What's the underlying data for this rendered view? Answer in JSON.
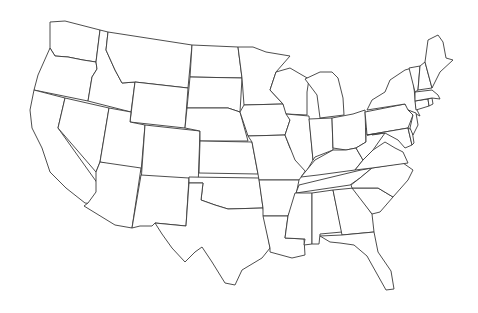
{
  "map": {
    "title": "",
    "type": "blank-outline",
    "region": "contiguous-united-states",
    "colors": {
      "background": "#ffffff",
      "fill": "#ffffff",
      "stroke": "#3a3a3a"
    },
    "states": [
      {
        "id": "WA",
        "d": "M50,22 L65,21 L100,30 L96,62 L83,60 L68,57 L55,56 L50,48 Z"
      },
      {
        "id": "OR",
        "d": "M50,48 L55,56 L68,57 L83,60 L96,62 L97,69 L92,77 L88,101 L34,90 L38,75 Z"
      },
      {
        "id": "CA",
        "d": "M34,90 L65,98 L58,128 L103,191 L102,205 L85,203 L66,188 L50,172 L42,148 L32,128 L30,110 Z"
      },
      {
        "id": "NV",
        "d": "M65,98 L109,108 L100,162 L96,172 L58,128 Z"
      },
      {
        "id": "ID",
        "d": "M100,30 L108,32 L106,50 L115,70 L122,83 L135,82 L131,112 L88,101 L92,77 L97,69 L96,62 Z"
      },
      {
        "id": "MT",
        "d": "M108,32 L192,45 L188,88 L135,82 L122,83 L115,70 L106,50 Z"
      },
      {
        "id": "WY",
        "d": "M135,82 L188,88 L185,128 L130,122 Z"
      },
      {
        "id": "UT",
        "d": "M109,108 L131,112 L130,122 L145,125 L141,172 L100,162 Z"
      },
      {
        "id": "AZ",
        "d": "M100,162 L141,168 L132,228 L115,225 L84,206 L88,203 L96,192 L96,172 Z"
      },
      {
        "id": "CO",
        "d": "M145,125 L200,131 L198,188 L141,182 Z"
      },
      {
        "id": "NM",
        "d": "M141,175 L189,178 L186,226 L155,223 L152,226 L140,226 L132,228 Z"
      },
      {
        "id": "ND",
        "d": "M192,45 L238,47 L242,78 L190,77 Z"
      },
      {
        "id": "SD",
        "d": "M190,77 L242,78 L240,112 L228,108 L187,108 Z"
      },
      {
        "id": "NE",
        "d": "M187,108 L228,108 L240,112 L248,141 L200,141 L200,131 L185,128 Z"
      },
      {
        "id": "KS",
        "d": "M200,141 L252,142 L258,174 L199,173 Z"
      },
      {
        "id": "OK",
        "d": "M189,177 L259,178 L263,208 L228,209 L215,205 L201,200 L203,183 L189,183 Z"
      },
      {
        "id": "TX",
        "d": "M189,183 L203,183 L201,200 L215,205 L228,209 L263,208 L270,248 L262,258 L242,270 L235,285 L225,283 L212,262 L202,247 L195,252 L185,262 L172,248 L162,234 L155,223 L186,226 Z"
      },
      {
        "id": "MN",
        "d": "M238,47 L253,47 L266,52 L290,56 L276,72 L270,90 L283,104 L244,105 L242,78 Z"
      },
      {
        "id": "IA",
        "d": "M244,105 L283,104 L290,120 L285,135 L248,136 L240,112 Z"
      },
      {
        "id": "MO",
        "d": "M248,136 L285,135 L290,148 L306,170 L299,180 L259,180 L258,174 L252,142 Z"
      },
      {
        "id": "AR",
        "d": "M259,180 L299,180 L295,200 L288,216 L263,216 L263,208 Z"
      },
      {
        "id": "LA",
        "d": "M263,216 L288,216 L285,238 L304,239 L305,255 L292,258 L270,252 L270,248 Z"
      },
      {
        "id": "WI",
        "d": "M270,90 L276,72 L290,68 L302,75 L309,79 L307,92 L307,115 L286,114 L283,104 Z"
      },
      {
        "id": "IL",
        "d": "M286,114 L309,116 L313,160 L306,172 L295,160 L285,135 L290,120 Z"
      },
      {
        "id": "MI",
        "d": "M305,79 L320,72 L332,72 L338,78 L343,98 L344,115 L320,118 L317,95 Z"
      },
      {
        "id": "IN",
        "d": "M309,119 L332,118 L333,150 L315,157 L313,160 Z"
      },
      {
        "id": "OH",
        "d": "M332,118 L353,114 L365,110 L366,142 L356,148 L346,150 L333,148 Z"
      },
      {
        "id": "KY",
        "d": "M301,177 L315,160 L333,150 L346,150 L356,148 L363,160 L355,170 L318,175 Z"
      },
      {
        "id": "TN",
        "d": "M299,185 L361,170 L372,168 L360,178 L350,185 L296,193 Z"
      },
      {
        "id": "MS",
        "d": "M295,193 L312,193 L312,244 L304,245 L305,239 L285,238 L288,216 Z"
      },
      {
        "id": "AL",
        "d": "M312,193 L333,190 L342,232 L320,234 L319,244 L312,244 Z"
      },
      {
        "id": "GA",
        "d": "M333,190 L354,188 L372,214 L374,232 L342,235 Z"
      },
      {
        "id": "FL",
        "d": "M320,236 L342,235 L374,232 L378,252 L391,271 L394,289 L386,290 L372,265 L367,256 L354,245 L340,243 L330,242 Z"
      },
      {
        "id": "SC",
        "d": "M352,188 L378,188 L393,197 L380,212 L372,214 Z"
      },
      {
        "id": "NC",
        "d": "M351,185 L360,178 L372,168 L403,163 L413,170 L408,180 L393,197 L378,188 L352,188 Z"
      },
      {
        "id": "VA",
        "d": "M355,170 L363,160 L373,150 L385,142 L395,148 L403,152 L408,163 L372,168 Z"
      },
      {
        "id": "WV",
        "d": "M356,148 L366,142 L366,128 L372,135 L385,133 L380,140 L373,150 L363,160 Z"
      },
      {
        "id": "PA",
        "d": "M365,112 L405,104 L413,115 L408,128 L367,135 Z"
      },
      {
        "id": "NY",
        "d": "M367,110 L372,100 L385,92 L390,80 L405,70 L412,68 L416,108 L420,116 L408,110 L405,104 Z"
      },
      {
        "id": "MD",
        "d": "M367,135 L408,128 L412,145 L405,148 L398,140 L385,133 Z"
      },
      {
        "id": "DE",
        "d": "M408,128 L412,130 L414,143 L412,145 Z"
      },
      {
        "id": "NJ",
        "d": "M408,110 L416,113 L418,125 L413,135 L410,128 L413,115 Z"
      },
      {
        "id": "CT",
        "d": "M415,101 L428,99 L429,106 L416,110 Z"
      },
      {
        "id": "RI",
        "d": "M428,99 L432,98 L433,104 L429,106 Z"
      },
      {
        "id": "MA",
        "d": "M415,92 L432,90 L438,95 L440,99 L432,98 L415,101 Z"
      },
      {
        "id": "VT",
        "d": "M409,68 L420,66 L418,90 L415,92 Z"
      },
      {
        "id": "NH",
        "d": "M420,66 L425,62 L432,88 L418,90 Z"
      },
      {
        "id": "ME",
        "d": "M425,62 L428,40 L438,35 L443,42 L446,58 L453,60 L440,72 L432,88 Z"
      }
    ]
  }
}
